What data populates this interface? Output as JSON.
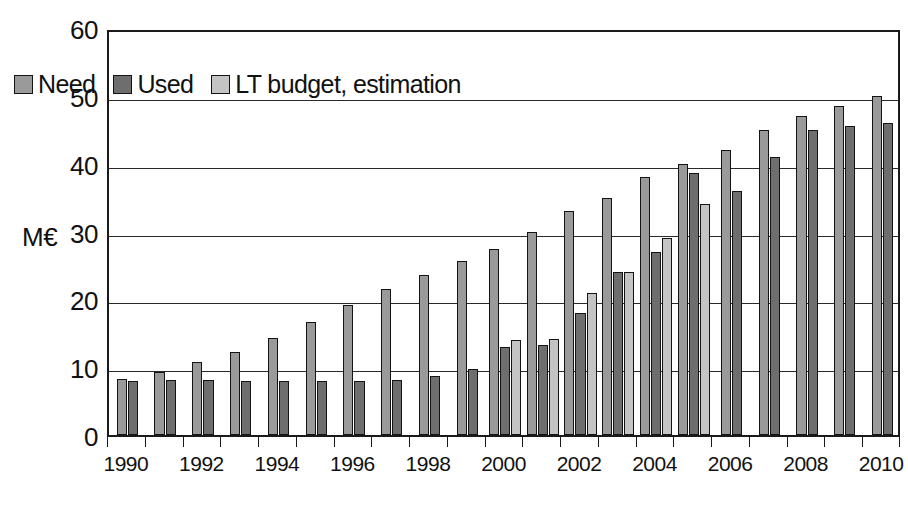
{
  "chart_data": {
    "type": "bar",
    "title": "",
    "subtitle": "",
    "xlabel": "",
    "ylabel": "M€",
    "ylim": [
      0,
      60
    ],
    "ytick_values": [
      0,
      10,
      20,
      30,
      40,
      50,
      60
    ],
    "ytick_labels": [
      "0",
      "10",
      "20",
      "30",
      "40",
      "50",
      "60"
    ],
    "grid": true,
    "grid_axis": "y",
    "legend_position": "upper-left-inside",
    "categories": [
      "1990",
      "1991",
      "1992",
      "1993",
      "1994",
      "1995",
      "1996",
      "1997",
      "1998",
      "1999",
      "2000",
      "2001",
      "2002",
      "2003",
      "2004",
      "2005",
      "2006",
      "2007",
      "2008",
      "2009",
      "2010"
    ],
    "xtick_labels": [
      "1990",
      "1992",
      "1994",
      "1996",
      "1998",
      "2000",
      "2002",
      "2004",
      "2006",
      "2008",
      "2010"
    ],
    "series": [
      {
        "name": "Need",
        "color": "#9a9a9a",
        "values": [
          8.2,
          9.3,
          10.8,
          12.3,
          14.3,
          16.6,
          19.2,
          21.5,
          23.6,
          25.6,
          27.4,
          30.0,
          33.0,
          35.0,
          38.0,
          40.0,
          42.0,
          45.0,
          47.0,
          48.5,
          50.0
        ]
      },
      {
        "name": "Used",
        "color": "#6e6e6e",
        "values": [
          7.9,
          8.1,
          8.1,
          8.0,
          8.0,
          8.0,
          8.0,
          8.1,
          8.7,
          9.8,
          13.0,
          13.3,
          18.0,
          24.0,
          27.0,
          38.7,
          36.0,
          41.0,
          45.0,
          45.5,
          46.0
        ]
      },
      {
        "name": "LT budget, estimation",
        "color": "#c4c4c4",
        "values": [
          null,
          null,
          null,
          null,
          null,
          null,
          null,
          null,
          null,
          null,
          14.0,
          14.2,
          21.0,
          24.0,
          29.0,
          34.0,
          null,
          null,
          null,
          null,
          null
        ]
      }
    ]
  },
  "legend": {
    "entries": [
      {
        "label": "Need",
        "color": "#9a9a9a"
      },
      {
        "label": "Used",
        "color": "#6e6e6e"
      },
      {
        "label": "LT budget, estimation",
        "color": "#c4c4c4"
      }
    ]
  },
  "axis": {
    "unit_label": "M€"
  }
}
